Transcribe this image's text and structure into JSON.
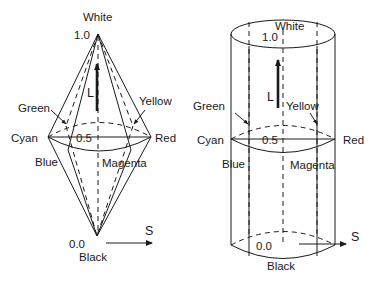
{
  "figure": {
    "colors": {
      "ink": "#1a1a1a",
      "background": "#ffffff"
    }
  },
  "double_cone": {
    "top_label": "White",
    "top_value": "1.0",
    "mid_value": "0.5",
    "bottom_value": "0.0",
    "bottom_label": "Black",
    "lightness_axis": "L",
    "saturation_axis": "S",
    "hues": {
      "green": "Green",
      "yellow": "Yellow",
      "cyan": "Cyan",
      "red": "Red",
      "blue": "Blue",
      "magenta": "Magenta"
    }
  },
  "cylinder": {
    "top_label": "White",
    "top_value": "1.0",
    "mid_value": "0.5",
    "bottom_value": "0.0",
    "bottom_label": "Black",
    "lightness_axis": "L",
    "saturation_axis": "S",
    "hues": {
      "green": "Green",
      "yellow": "Yellow",
      "cyan": "Cyan",
      "red": "Red",
      "blue": "Blue",
      "magenta": "Magenta"
    }
  }
}
